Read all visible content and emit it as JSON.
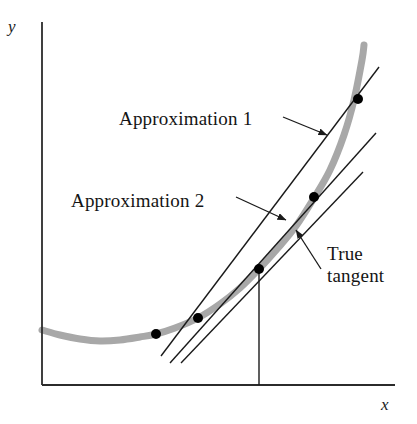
{
  "figure": {
    "kind": "math-diagram",
    "background_color": "#ffffff",
    "curve_color": "#a8a8a8",
    "line_color": "#1a1a1a",
    "axis_color": "#2b2b2b",
    "point_color": "#000000"
  },
  "axes": {
    "y_label": "y",
    "x_label": "x",
    "y_axis": {
      "x": 42,
      "y_top": 22,
      "y_bottom": 385
    },
    "x_axis": {
      "y": 385,
      "x_left": 42,
      "x_right": 395
    }
  },
  "labels": {
    "approximation_1": "Approximation 1",
    "approximation_2": "Approximation 2",
    "true_tangent_line_1": "True",
    "true_tangent_line_2": "tangent"
  },
  "chart_data": {
    "type": "line",
    "title": "",
    "xlabel": "x",
    "ylabel": "y",
    "grid": false,
    "legend": "none",
    "curve": {
      "name": "function curve",
      "color": "#a8a8a8",
      "stroke_width": 7,
      "points": [
        [
          42,
          330
        ],
        [
          60,
          335
        ],
        [
          80,
          339
        ],
        [
          100,
          341
        ],
        [
          120,
          340
        ],
        [
          140,
          337
        ],
        [
          156,
          334
        ],
        [
          175,
          328
        ],
        [
          198,
          318
        ],
        [
          220,
          304
        ],
        [
          240,
          288
        ],
        [
          259,
          269
        ],
        [
          278,
          248
        ],
        [
          296,
          226
        ],
        [
          314,
          198
        ],
        [
          330,
          170
        ],
        [
          344,
          135
        ],
        [
          354,
          100
        ],
        [
          362,
          60
        ],
        [
          364,
          45
        ]
      ]
    },
    "lines": [
      {
        "name": "Approximation 1",
        "note": "secant from leftmost point to topmost point",
        "from": [
          161,
          356
        ],
        "to": [
          379,
          67
        ],
        "color": "#1a1a1a",
        "stroke_width": 1.4
      },
      {
        "name": "Approximation 2",
        "note": "secant from leftmost point to middle point",
        "from": [
          170,
          363
        ],
        "to": [
          376,
          133
        ],
        "color": "#1a1a1a",
        "stroke_width": 1.4
      },
      {
        "name": "True tangent",
        "note": "tangent line touching the curve at the marked abscissa",
        "from": [
          181,
          363
        ],
        "to": [
          363,
          172
        ],
        "color": "#1a1a1a",
        "stroke_width": 1.4
      }
    ],
    "drop_line": {
      "from": [
        259,
        269
      ],
      "to": [
        259,
        385
      ]
    },
    "points": [
      {
        "x": 156,
        "y": 334,
        "note": "base point - common point of all lines"
      },
      {
        "x": 198,
        "y": 318,
        "note": "tangent-line intersection point"
      },
      {
        "x": 259,
        "y": 269,
        "note": "point of tangency on curve"
      },
      {
        "x": 314,
        "y": 197,
        "note": "Approximation 2 secant endpoint"
      },
      {
        "x": 358,
        "y": 99,
        "note": "Approximation 1 secant endpoint"
      }
    ],
    "annotations": [
      {
        "text": "Approximation 1",
        "text_pos": [
          119,
          108
        ],
        "leader_from": [
          283,
          117
        ],
        "leader_to": [
          327,
          135
        ]
      },
      {
        "text": "Approximation 2",
        "text_pos": [
          71,
          190
        ],
        "leader_from": [
          236,
          197
        ],
        "leader_to": [
          286,
          220
        ]
      },
      {
        "text": "True tangent",
        "text_pos": [
          327,
          243
        ],
        "leader_from": [
          321,
          269
        ],
        "leader_to": [
          296,
          230
        ]
      }
    ]
  }
}
